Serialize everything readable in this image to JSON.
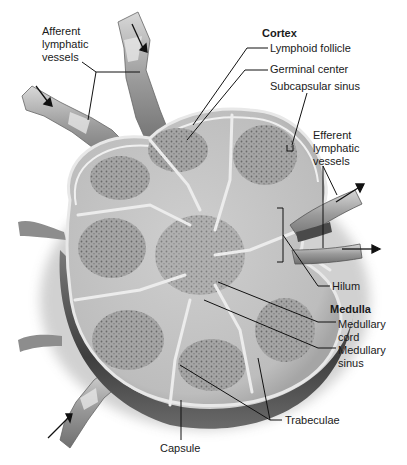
{
  "colors": {
    "capsule_dark": "#4a4a4a",
    "capsule_mid": "#8a8a8a",
    "parenchyma": "#c9c9c9",
    "follicle": "#9c9c9c",
    "trabecula": "#e4e4e4",
    "vessel": "#a8a8a8",
    "leader": "#111111"
  },
  "labels": {
    "afferent": "Afferent\nlymphatic\nvessels",
    "cortex_heading": "Cortex",
    "lymphoid_follicle": "Lymphoid follicle",
    "germinal_center": "Germinal center",
    "subcapsular_sinus": "Subcapsular sinus",
    "efferent": "Efferent\nlymphatic\nvessels",
    "hilum": "Hilum",
    "medulla_heading": "Medulla",
    "medullary_cord": "Medullary\ncord",
    "medullary_sinus": "Medullary\nsinus",
    "trabeculae": "Trabeculae",
    "capsule": "Capsule"
  }
}
